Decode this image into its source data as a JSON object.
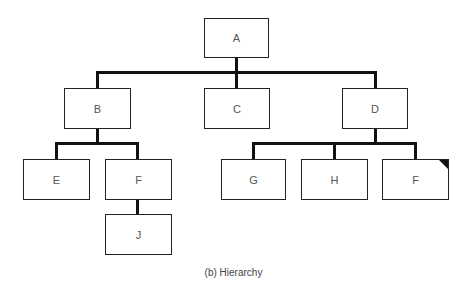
{
  "nodes": {
    "a": {
      "label": "A"
    },
    "b": {
      "label": "B"
    },
    "c": {
      "label": "C"
    },
    "d": {
      "label": "D"
    },
    "e": {
      "label": "E"
    },
    "f": {
      "label": "F"
    },
    "g": {
      "label": "G"
    },
    "h": {
      "label": "H"
    },
    "f2": {
      "label": "F"
    },
    "j": {
      "label": "J"
    }
  },
  "edges": [
    [
      "A",
      "B"
    ],
    [
      "A",
      "C"
    ],
    [
      "A",
      "D"
    ],
    [
      "B",
      "E"
    ],
    [
      "B",
      "F"
    ],
    [
      "F",
      "J"
    ],
    [
      "D",
      "G"
    ],
    [
      "D",
      "H"
    ],
    [
      "D",
      "F"
    ]
  ],
  "caption": "(b)  Hierarchy"
}
